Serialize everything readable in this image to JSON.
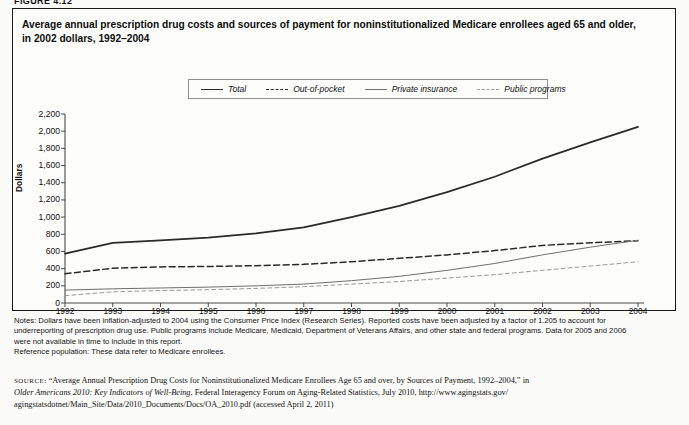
{
  "figure": {
    "label": "FIGURE 4.12",
    "title_line1": "Average annual prescription drug costs and sources of payment for noninstitutionalized Medicare enrollees aged 65 and older,",
    "title_line2": "in 2002 dollars, 1992–2004"
  },
  "legend": {
    "position": "top-center",
    "items": [
      {
        "label": "Total",
        "style": "solid-thick",
        "color": "#2a2a2a"
      },
      {
        "label": "Out-of-pocket",
        "style": "dashed",
        "color": "#2a2a2a"
      },
      {
        "label": "Private insurance",
        "style": "solid-thin",
        "color": "#6e6e6e"
      },
      {
        "label": "Public programs",
        "style": "dotted",
        "color": "#9a9a9a"
      }
    ]
  },
  "axes": {
    "ylabel": "Dollars",
    "yticks": [
      "2,200",
      "2,000",
      "1,800",
      "1,600",
      "1,400",
      "1,200",
      "1,000",
      "800",
      "600",
      "400",
      "200",
      "0"
    ],
    "xticks": [
      "1992",
      "1993",
      "1994",
      "1995",
      "1996",
      "1997",
      "1998",
      "1999",
      "2000",
      "2001",
      "2002",
      "2003",
      "2004"
    ]
  },
  "chart_data": {
    "type": "line",
    "title": "Average annual prescription drug costs and sources of payment for noninstitutionalized Medicare enrollees aged 65 and older, in 2002 dollars, 1992–2004",
    "xlabel": "",
    "ylabel": "Dollars",
    "x": [
      1992,
      1993,
      1994,
      1995,
      1996,
      1997,
      1998,
      1999,
      2000,
      2001,
      2002,
      2003,
      2004
    ],
    "xlim": [
      1992,
      2004
    ],
    "ylim": [
      0,
      2200
    ],
    "ytick_step": 200,
    "grid": false,
    "legend_position": "top-center",
    "series": [
      {
        "name": "Total",
        "style": "solid-thick",
        "color": "#2a2a2a",
        "values": [
          575,
          700,
          730,
          760,
          810,
          880,
          1000,
          1130,
          1290,
          1470,
          1680,
          1870,
          2050
        ]
      },
      {
        "name": "Out-of-pocket",
        "style": "dashed",
        "color": "#2a2a2a",
        "values": [
          340,
          405,
          420,
          425,
          435,
          450,
          480,
          520,
          560,
          610,
          670,
          700,
          725
        ]
      },
      {
        "name": "Private insurance",
        "style": "solid-thin",
        "color": "#6e6e6e",
        "values": [
          150,
          165,
          175,
          185,
          200,
          220,
          260,
          310,
          380,
          460,
          560,
          650,
          730
        ]
      },
      {
        "name": "Public programs",
        "style": "dotted",
        "color": "#9a9a9a",
        "values": [
          85,
          130,
          145,
          155,
          170,
          190,
          220,
          250,
          290,
          330,
          380,
          430,
          480
        ]
      }
    ]
  },
  "notes": {
    "lines": [
      "Notes: Dollars have been inflation-adjusted to 2004 using the Consumer Price Index (Research Series). Reported costs have been adjusted by a factor of 1.205 to account for",
      "underreporting of prescription drug use. Public programs include Medicare, Medicaid, Department of Veterans Affairs, and other state and federal programs. Data for 2005 and 2006",
      "were not available in time to include in this report.",
      "Reference population: These data refer to Medicare enrollees."
    ]
  },
  "source": {
    "label": "source:",
    "line1_a": " “Average Annual Prescription Drug Costs for Noninstitutionalized Medicare Enrollees Age 65 and over, by Sources of Payment, 1992–2004,” in",
    "line2_italic": "Older Americans 2010: Key Indicators of Well-Being",
    "line2_b": ", Federal Interagency Forum on Aging-Related Statistics, July 2010, http://www.agingstats.gov/",
    "line3": "agingstatsdotnet/Main_Site/Data/2010_Documents/Docs/OA_2010.pdf (accessed April 2, 2011)"
  }
}
